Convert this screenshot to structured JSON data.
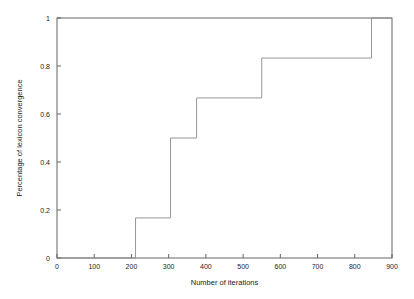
{
  "chart_data": {
    "type": "line",
    "subtype": "step",
    "title": "",
    "xlabel": "Number of iterations",
    "ylabel": "Percentage of lexicon convergence",
    "xlim": [
      0,
      900
    ],
    "ylim": [
      0,
      1
    ],
    "grid": false,
    "legend": null,
    "x_ticks": [
      0,
      100,
      200,
      300,
      400,
      500,
      600,
      700,
      800,
      900
    ],
    "x_tick_labels": [
      "0",
      "100",
      "200",
      "300",
      "400",
      "500",
      "600",
      "700",
      "800",
      "900"
    ],
    "y_ticks": [
      0,
      0.2,
      0.4,
      0.6,
      0.8,
      1
    ],
    "y_tick_labels": [
      "0",
      "0.2",
      "0.4",
      "0.6",
      "0.8",
      "1"
    ],
    "series": [
      {
        "name": "lexicon convergence",
        "color": "#8a8a8a",
        "step_type": "post",
        "x": [
          0,
          211,
          211,
          305,
          305,
          375,
          375,
          550,
          550,
          845,
          845,
          900
        ],
        "y": [
          0,
          0,
          0.167,
          0.167,
          0.5,
          0.5,
          0.667,
          0.667,
          0.833,
          0.833,
          1,
          1
        ]
      }
    ],
    "step_transitions": [
      {
        "iterations": 211,
        "from": 0,
        "to": 0.167
      },
      {
        "iterations": 305,
        "from": 0.167,
        "to": 0.5
      },
      {
        "iterations": 375,
        "from": 0.5,
        "to": 0.667
      },
      {
        "iterations": 550,
        "from": 0.667,
        "to": 0.833
      },
      {
        "iterations": 845,
        "from": 0.833,
        "to": 1
      }
    ],
    "plateau_values": [
      0,
      0.167,
      0.5,
      0.667,
      0.833,
      1
    ]
  },
  "colors": {
    "background": "#ffffff",
    "axis": "#555555",
    "line": "#8a8a8a",
    "text": "#1a1a1a"
  }
}
